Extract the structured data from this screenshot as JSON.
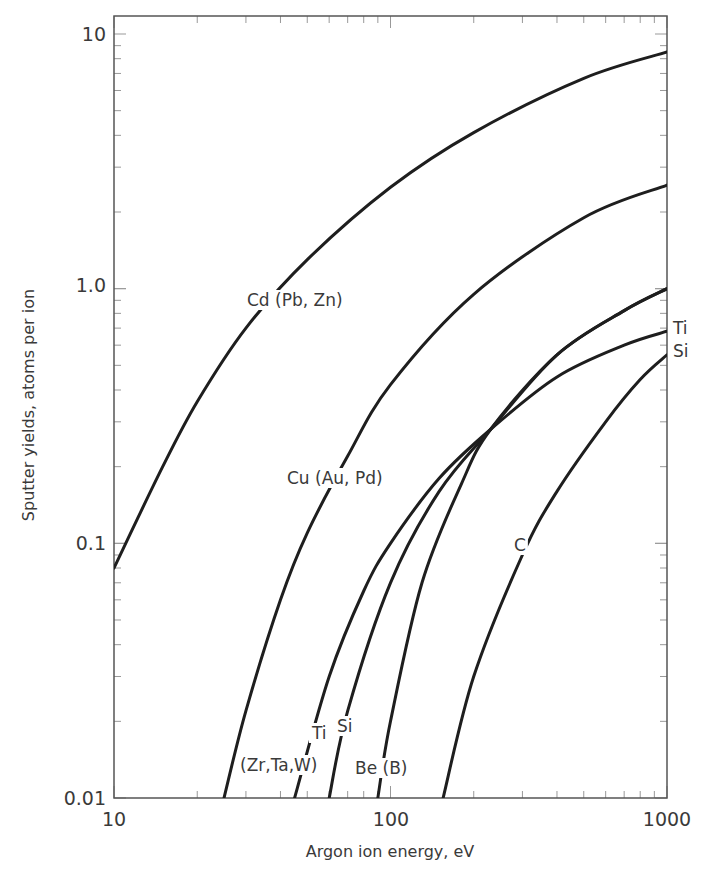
{
  "chart_data": {
    "type": "line",
    "title": "",
    "xlabel": "Argon ion energy, eV",
    "ylabel": "Sputter yields, atoms per ion",
    "xscale": "log",
    "yscale": "log",
    "xlim": [
      10,
      1000
    ],
    "ylim": [
      0.01,
      10
    ],
    "grid": false,
    "legend": "none (curves labeled inline)",
    "x_ticks": [
      {
        "value": 10,
        "label": "10"
      },
      {
        "value": 100,
        "label": "100"
      },
      {
        "value": 1000,
        "label": "1000"
      }
    ],
    "y_ticks": [
      {
        "value": 10,
        "label": "10"
      },
      {
        "value": 1,
        "label": "1.0"
      },
      {
        "value": 0.1,
        "label": "0.1"
      },
      {
        "value": 0.01,
        "label": "0.01"
      }
    ],
    "series": [
      {
        "name": "Cd (Pb, Zn)",
        "x": [
          10,
          15,
          20,
          30,
          50,
          100,
          200,
          500,
          1000
        ],
        "y": [
          0.08,
          0.2,
          0.36,
          0.7,
          1.3,
          2.5,
          4.1,
          6.7,
          8.5
        ]
      },
      {
        "name": "Cu (Au, Pd)",
        "x": [
          25,
          30,
          40,
          50,
          70,
          100,
          200,
          500,
          1000
        ],
        "y": [
          0.01,
          0.022,
          0.06,
          0.11,
          0.22,
          0.42,
          0.95,
          1.9,
          2.55
        ]
      },
      {
        "name": "Ti (Zr, Ta, W)",
        "x": [
          45,
          60,
          80,
          100,
          150,
          230,
          400,
          700,
          1000
        ],
        "y": [
          0.01,
          0.03,
          0.065,
          0.1,
          0.18,
          0.28,
          0.45,
          0.6,
          0.68
        ]
      },
      {
        "name": "Si",
        "x": [
          60,
          70,
          100,
          150,
          230,
          400,
          700,
          1000
        ],
        "y": [
          0.01,
          0.022,
          0.07,
          0.16,
          0.28,
          0.55,
          0.82,
          1.0
        ]
      },
      {
        "name": "Be (B)",
        "x": [
          90,
          100,
          130,
          180,
          230,
          400,
          700,
          1000
        ],
        "y": [
          0.01,
          0.02,
          0.07,
          0.17,
          0.28,
          0.55,
          0.82,
          1.0
        ]
      },
      {
        "name": "C",
        "x": [
          155,
          200,
          300,
          400,
          600,
          800,
          1000
        ],
        "y": [
          0.01,
          0.03,
          0.09,
          0.16,
          0.3,
          0.44,
          0.55
        ]
      }
    ],
    "annotations": [
      {
        "text": "Cd (Pb, Zn)",
        "x": 247,
        "y": 306
      },
      {
        "text": "Cu (Au, Pd)",
        "x": 287,
        "y": 484
      },
      {
        "text": "Ti",
        "x": 312,
        "y": 739
      },
      {
        "text": "Si",
        "x": 337,
        "y": 732
      },
      {
        "text": "(Zr,Ta,W)",
        "x": 240,
        "y": 771
      },
      {
        "text": "Be (B)",
        "x": 355,
        "y": 774
      },
      {
        "text": "C",
        "x": 514,
        "y": 551
      },
      {
        "text": "Ti",
        "x": 673,
        "y": 334
      },
      {
        "text": "Si",
        "x": 673,
        "y": 357
      }
    ]
  },
  "axes": {
    "x_title": "Argon ion energy, eV",
    "y_title": "Sputter yields, atoms per ion",
    "x_labels": [
      "10",
      "100",
      "1000"
    ],
    "y_labels": [
      "10",
      "1.0",
      "0.1",
      "0.01"
    ]
  }
}
